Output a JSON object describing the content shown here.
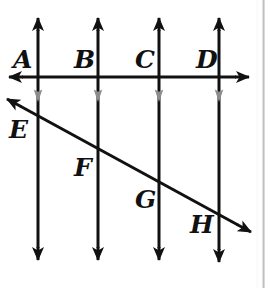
{
  "figure": {
    "background_color": "#ffffff",
    "line_color": "#111111",
    "tick_mark_color": "#8c8c8c",
    "labels": {
      "A": "A",
      "B": "B",
      "C": "C",
      "D": "D",
      "E": "E",
      "F": "F",
      "G": "G",
      "H": "H"
    },
    "label_positions": {
      "A": {
        "x": 13,
        "y": 47
      },
      "B": {
        "x": 74,
        "y": 47
      },
      "C": {
        "x": 135,
        "y": 47
      },
      "D": {
        "x": 196,
        "y": 47
      },
      "E": {
        "x": 9,
        "y": 117
      },
      "F": {
        "x": 74,
        "y": 155
      },
      "G": {
        "x": 135,
        "y": 187
      },
      "H": {
        "x": 190,
        "y": 212
      }
    },
    "vertical_lines": [
      {
        "name": "line-A",
        "x": 38,
        "top_y": 17,
        "bottom_y": 261
      },
      {
        "name": "line-B",
        "x": 98,
        "top_y": 17,
        "bottom_y": 261
      },
      {
        "name": "line-C",
        "x": 159,
        "top_y": 17,
        "bottom_y": 261
      },
      {
        "name": "line-D",
        "x": 219,
        "top_y": 17,
        "bottom_y": 263
      }
    ],
    "horizontal_line": {
      "name": "horizontal-transversal",
      "y": 77,
      "left_x": 8,
      "right_x": 250
    },
    "diagonal_line": {
      "name": "diagonal-transversal",
      "x1": 6,
      "y1": 99,
      "x2": 252,
      "y2": 233
    },
    "parallel_tick_marks_y": 96,
    "intersection_points": [
      {
        "label": "E",
        "line": "A",
        "x": 38,
        "y": 117
      },
      {
        "label": "F",
        "line": "B",
        "x": 98,
        "y": 150
      },
      {
        "label": "G",
        "line": "C",
        "x": 159,
        "y": 183
      },
      {
        "label": "H",
        "line": "D",
        "x": 219,
        "y": 216
      }
    ]
  }
}
